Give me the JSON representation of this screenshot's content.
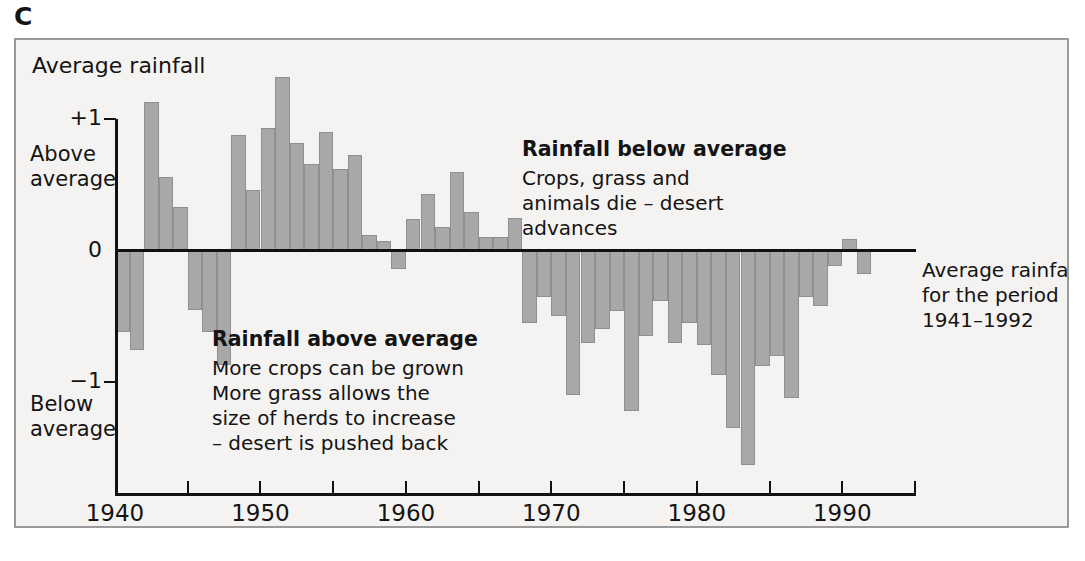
{
  "figure": {
    "label": "C"
  },
  "chart_data": {
    "type": "bar",
    "title": "Average rainfall",
    "xlabel": "",
    "ylabel": "Average rainfall",
    "ylim": [
      -1.75,
      1.45
    ],
    "xlim": [
      1940,
      1995
    ],
    "grid": false,
    "legend": null,
    "y_ticks": [
      {
        "value": 1,
        "label": "+1"
      },
      {
        "value": 0,
        "label": "0"
      },
      {
        "value": -1,
        "label": "−1"
      }
    ],
    "y_axis_captions": [
      {
        "value": 0.72,
        "lines": [
          "Above",
          "average"
        ]
      },
      {
        "value": -1.18,
        "lines": [
          "Below",
          "average"
        ]
      }
    ],
    "x_ticks": [
      1940,
      1945,
      1950,
      1955,
      1960,
      1965,
      1970,
      1975,
      1980,
      1985,
      1990,
      1995
    ],
    "x_tick_labels": [
      {
        "value": 1940,
        "label": "1940"
      },
      {
        "value": 1950,
        "label": "1950"
      },
      {
        "value": 1960,
        "label": "1960"
      },
      {
        "value": 1970,
        "label": "1970"
      },
      {
        "value": 1980,
        "label": "1980"
      },
      {
        "value": 1990,
        "label": "1990"
      }
    ],
    "bar_color": "#a8a8a8",
    "bar_edge_color": "#8f8f8f",
    "categories": [
      1941,
      1942,
      1943,
      1944,
      1945,
      1946,
      1947,
      1948,
      1949,
      1950,
      1951,
      1952,
      1953,
      1954,
      1955,
      1956,
      1957,
      1958,
      1959,
      1960,
      1961,
      1962,
      1963,
      1964,
      1965,
      1966,
      1967,
      1968,
      1969,
      1970,
      1971,
      1972,
      1973,
      1974,
      1975,
      1976,
      1977,
      1978,
      1979,
      1980,
      1981,
      1982,
      1983,
      1984,
      1985,
      1986,
      1987,
      1988,
      1989,
      1990,
      1991,
      1992
    ],
    "values": [
      -0.62,
      -0.76,
      1.13,
      0.56,
      0.33,
      -0.45,
      -0.62,
      -0.87,
      0.88,
      0.46,
      0.93,
      1.32,
      0.82,
      0.66,
      0.9,
      0.62,
      0.73,
      0.12,
      0.07,
      -0.14,
      0.24,
      0.43,
      0.18,
      0.6,
      0.29,
      0.1,
      0.1,
      0.25,
      -0.55,
      -0.35,
      -0.5,
      -1.1,
      -0.7,
      -0.6,
      -0.46,
      -1.22,
      -0.65,
      -0.38,
      -0.7,
      -0.55,
      -0.72,
      -0.95,
      -1.35,
      -1.63,
      -0.88,
      -0.8,
      -1.12,
      -0.35,
      -0.42,
      -0.12,
      0.09,
      -0.18
    ],
    "annotations": [
      {
        "id": "above-average",
        "title": "Rainfall above average",
        "lines": [
          "More crops can be grown",
          "More grass allows the",
          "size of herds to increase",
          "– desert is pushed back"
        ]
      },
      {
        "id": "below-average",
        "title": "Rainfall below average",
        "lines": [
          "Crops, grass and",
          "animals die – desert",
          "advances"
        ]
      },
      {
        "id": "period-note",
        "title": "",
        "lines": [
          "Average rainfall",
          "for the period",
          "1941–1992"
        ]
      }
    ]
  }
}
